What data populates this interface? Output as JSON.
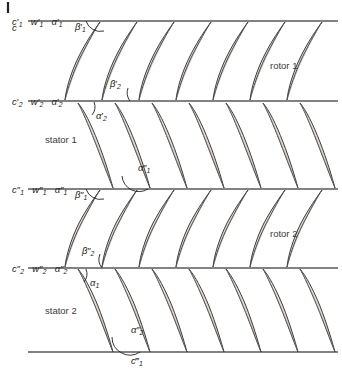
{
  "figure": {
    "kind": "turbomachinery-cascade-diagram",
    "width": 342,
    "height": 376,
    "background": "#ffffff",
    "line_color": "#58585a",
    "blade_outline_color": "#231f20",
    "blade_fill_color": "#dedad4"
  },
  "corner_tick": {
    "name": "crop-mark",
    "x": 8,
    "y_top": 2,
    "y_bottom": 13
  },
  "stations": [
    {
      "id": "station-1",
      "y": 21,
      "labels": [
        {
          "base": "c",
          "primes": "′",
          "sub": "1"
        },
        {
          "base": "w",
          "primes": "′",
          "sub": "1"
        },
        {
          "base": "α",
          "primes": "′",
          "sub": "1"
        }
      ],
      "text": "c′1 w′1 α′1"
    },
    {
      "id": "station-2",
      "y": 101,
      "labels": [
        {
          "base": "c",
          "primes": "′",
          "sub": "2"
        },
        {
          "base": "w",
          "primes": "′",
          "sub": "2"
        },
        {
          "base": "α",
          "primes": "′",
          "sub": "2"
        }
      ],
      "text": "c′2 w′2 α′2"
    },
    {
      "id": "station-3",
      "y": 189,
      "labels": [
        {
          "base": "c",
          "primes": "″",
          "sub": "1"
        },
        {
          "base": "w",
          "primes": "″",
          "sub": "1"
        },
        {
          "base": "α",
          "primes": "″",
          "sub": "1"
        }
      ],
      "text": "c″1 w″1 α″1"
    },
    {
      "id": "station-4",
      "y": 268,
      "labels": [
        {
          "base": "c",
          "primes": "″",
          "sub": "2"
        },
        {
          "base": "w",
          "primes": "″",
          "sub": "2"
        },
        {
          "base": "α",
          "primes": "″",
          "sub": "2"
        }
      ],
      "text": "c″2 w″2 α″2"
    },
    {
      "id": "station-5",
      "y": 352,
      "labels": [],
      "text": ""
    }
  ],
  "blade_rows": [
    {
      "id": "rotor-1",
      "label": "rotor 1",
      "label_x": 270,
      "label_y": 66,
      "type": "rotor",
      "top_y": 21,
      "bottom_y": 101,
      "blade_count": 7,
      "first_leading_edge_x": 100,
      "pitch": 37
    },
    {
      "id": "stator-1",
      "label": "stator 1",
      "label_x": 45,
      "label_y": 140,
      "type": "stator",
      "top_y": 101,
      "bottom_y": 189,
      "blade_count": 7,
      "first_leading_edge_x": 78,
      "pitch": 37
    },
    {
      "id": "rotor-2",
      "label": "rotor 2",
      "label_x": 270,
      "label_y": 234,
      "type": "rotor",
      "top_y": 189,
      "bottom_y": 268,
      "blade_count": 7,
      "first_leading_edge_x": 100,
      "pitch": 37
    },
    {
      "id": "stator-2",
      "label": "stator 2",
      "label_x": 45,
      "label_y": 311,
      "type": "stator",
      "top_y": 268,
      "bottom_y": 352,
      "blade_count": 7,
      "first_leading_edge_x": 78,
      "pitch": 37
    }
  ],
  "angles": [
    {
      "id": "beta-1-prime",
      "base": "β",
      "primes": "′",
      "sub": "1",
      "text": "β′1",
      "label_x": 80,
      "label_y": 27,
      "vertex_x": 101,
      "vertex_y": 22,
      "arc_radius": 15
    },
    {
      "id": "beta-2-prime",
      "base": "β",
      "primes": "′",
      "sub": "2",
      "text": "β′2",
      "label_x": 112,
      "label_y": 84,
      "vertex_x": 129,
      "vertex_y": 101,
      "arc_radius": 14
    },
    {
      "id": "alpha-2-prime",
      "base": "α",
      "primes": "′",
      "sub": "2",
      "text": "α′2",
      "label_x": 98,
      "label_y": 116,
      "vertex_x": 92,
      "vertex_y": 102,
      "arc_radius": 13
    },
    {
      "id": "alpha-1-double-prime",
      "base": "α",
      "primes": "″",
      "sub": "1",
      "text": "α″1",
      "label_x": 140,
      "label_y": 168,
      "vertex_x": 131,
      "vertex_y": 189,
      "arc_radius": 17
    },
    {
      "id": "beta-1-double-prime",
      "base": "β",
      "primes": "″",
      "sub": "1",
      "text": "β″1",
      "label_x": 80,
      "label_y": 195,
      "vertex_x": 101,
      "vertex_y": 190,
      "arc_radius": 15
    },
    {
      "id": "beta-2-double-prime",
      "base": "β",
      "primes": "″",
      "sub": "2",
      "text": "β″2",
      "label_x": 84,
      "label_y": 251,
      "vertex_x": 101,
      "vertex_y": 268,
      "arc_radius": 14
    },
    {
      "id": "alpha-1",
      "base": "α",
      "primes": "",
      "sub": "1",
      "text": "α1",
      "label_x": 92,
      "label_y": 283,
      "vertex_x": 84,
      "vertex_y": 269,
      "arc_radius": 13
    },
    {
      "id": "alpha-2-double-prime",
      "base": "α",
      "primes": "″",
      "sub": "2",
      "text": "α″2",
      "label_x": 133,
      "label_y": 330,
      "vertex_x": 122,
      "vertex_y": 352,
      "arc_radius": 18
    }
  ],
  "outlet_label": {
    "id": "c-1-triple-prime",
    "base": "c",
    "primes": "‴",
    "sub": "1",
    "text": "c‴1",
    "x": 133,
    "y": 358
  }
}
